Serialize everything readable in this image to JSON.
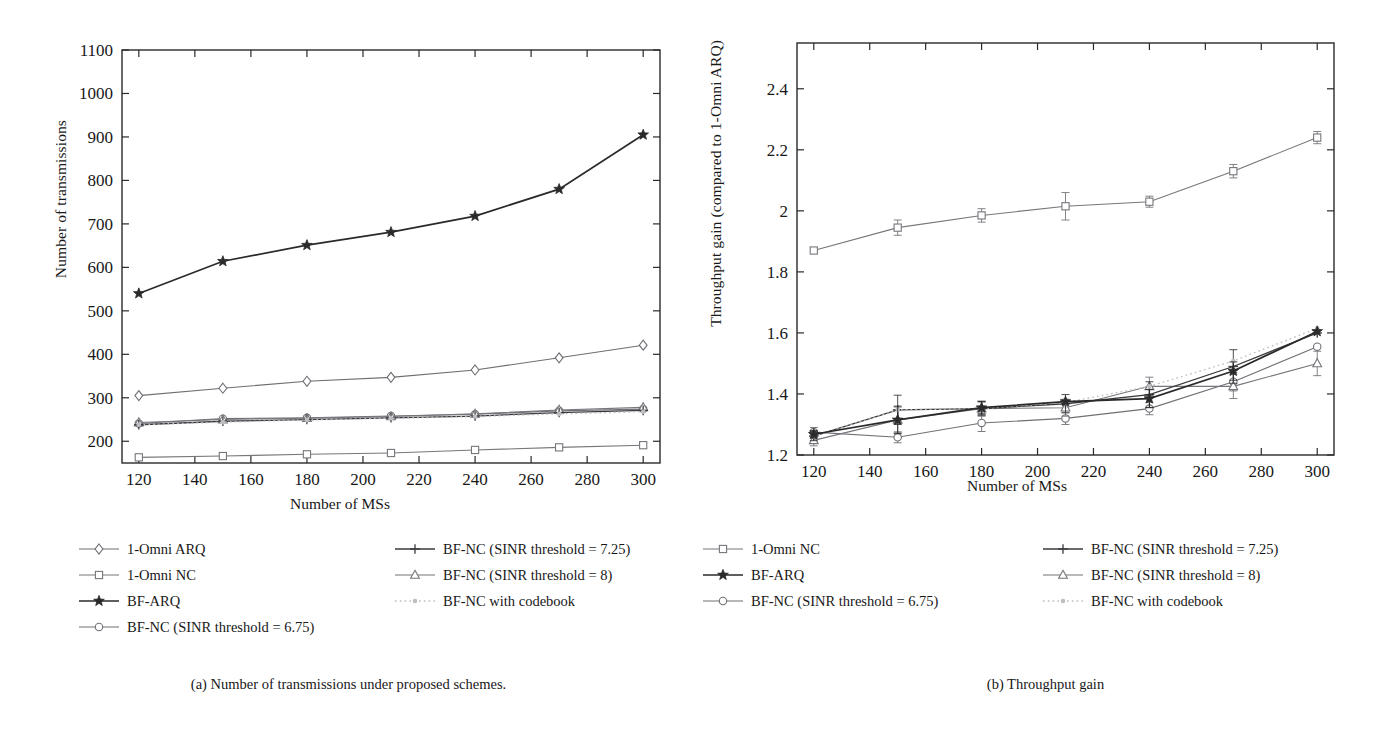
{
  "figure": {
    "panels": [
      {
        "id": "a",
        "caption": "(a)  Number of transmissions under proposed schemes.",
        "xlabel": "Number of MSs",
        "ylabel": "Number of transmissions"
      },
      {
        "id": "b",
        "caption": "(b)  Throughput gain",
        "xlabel": "Number of MSs",
        "ylabel": "Throughput gain (compared to 1-Omni ARQ)"
      }
    ]
  },
  "chart_data": [
    {
      "type": "line",
      "title": "(a)  Number of transmissions under proposed schemes.",
      "xlabel": "Number of MSs",
      "ylabel": "Number of transmissions",
      "x": [
        120,
        150,
        180,
        210,
        240,
        270,
        300
      ],
      "xlim": [
        114,
        306
      ],
      "ylim": [
        150,
        1100
      ],
      "xticks": [
        120,
        140,
        160,
        180,
        200,
        220,
        240,
        260,
        280,
        300
      ],
      "yticks": [
        200,
        300,
        400,
        500,
        600,
        700,
        800,
        900,
        1000,
        1100
      ],
      "grid": false,
      "legend_position": "below",
      "series": [
        {
          "name": "1-Omni ARQ",
          "marker": "diamond",
          "linestyle": "solid",
          "values": [
            305,
            322,
            338,
            347,
            364,
            392,
            421
          ]
        },
        {
          "name": "1-Omni NC",
          "marker": "square",
          "linestyle": "solid",
          "values": [
            163,
            166,
            170,
            173,
            180,
            186,
            191
          ]
        },
        {
          "name": "BF-ARQ",
          "marker": "star",
          "linestyle": "solid",
          "values": [
            540,
            614,
            651,
            681,
            718,
            780,
            905
          ]
        },
        {
          "name": "BF-NC (SINR threshold = 6.75)",
          "marker": "circle",
          "linestyle": "solid",
          "values": [
            241,
            252,
            254,
            258,
            262,
            270,
            274
          ]
        },
        {
          "name": "BF-NC (SINR threshold = 7.25)",
          "marker": "plus",
          "linestyle": "solid",
          "values": [
            238,
            246,
            250,
            254,
            258,
            266,
            271
          ]
        },
        {
          "name": "BF-NC (SINR threshold = 8)",
          "marker": "triangle",
          "linestyle": "solid",
          "values": [
            243,
            250,
            253,
            257,
            263,
            272,
            278
          ]
        },
        {
          "name": "BF-NC with codebook",
          "marker": "dot",
          "linestyle": "dotted",
          "values": [
            238,
            244,
            249,
            253,
            257,
            263,
            268
          ]
        }
      ]
    },
    {
      "type": "line",
      "title": "(b)  Throughput gain",
      "xlabel": "Number of MSs",
      "ylabel": "Throughput gain (compared to 1-Omni ARQ)",
      "x": [
        120,
        150,
        180,
        210,
        240,
        270,
        300
      ],
      "xlim": [
        114,
        306
      ],
      "ylim": [
        1.2,
        2.55
      ],
      "xticks": [
        120,
        140,
        160,
        180,
        200,
        220,
        240,
        260,
        280,
        300
      ],
      "yticks": [
        1.2,
        1.4,
        1.6,
        1.8,
        2,
        2.2,
        2.4
      ],
      "grid": false,
      "legend_position": "below",
      "errorbars": true,
      "series": [
        {
          "name": "1-Omni NC",
          "marker": "square",
          "linestyle": "solid",
          "values": [
            1.87,
            1.945,
            1.985,
            2.015,
            2.03,
            2.13,
            2.24
          ],
          "errors": [
            0.0,
            0.025,
            0.022,
            0.045,
            0.018,
            0.022,
            0.02
          ]
        },
        {
          "name": "BF-ARQ",
          "marker": "star",
          "linestyle": "solid",
          "values": [
            1.268,
            1.315,
            1.355,
            1.375,
            1.385,
            1.475,
            1.605
          ],
          "errors": [
            0.012,
            0.045,
            0.02,
            0.0,
            0.03,
            0.03,
            0.0
          ]
        },
        {
          "name": "BF-NC (SINR threshold = 6.75)",
          "marker": "circle",
          "linestyle": "solid",
          "values": [
            1.275,
            1.258,
            1.305,
            1.32,
            1.352,
            1.44,
            1.555
          ],
          "errors": [
            0.015,
            0.018,
            0.028,
            0.02,
            0.02,
            0.03,
            0.0
          ]
        },
        {
          "name": "BF-NC (SINR threshold = 7.25)",
          "marker": "plus",
          "linestyle": "solid",
          "values": [
            1.262,
            1.348,
            1.352,
            1.368,
            1.398,
            1.49,
            1.6
          ],
          "errors": [
            0.015,
            0.048,
            0.022,
            0.03,
            0.042,
            0.055,
            0.0
          ]
        },
        {
          "name": "BF-NC (SINR threshold = 8)",
          "marker": "triangle",
          "linestyle": "solid",
          "values": [
            1.248,
            1.315,
            1.352,
            1.355,
            1.425,
            1.425,
            1.5
          ],
          "errors": [
            0.018,
            0.042,
            0.025,
            0.028,
            0.03,
            0.04,
            0.04
          ]
        },
        {
          "name": "BF-NC with codebook",
          "marker": "dot",
          "linestyle": "dotted",
          "values": [
            1.262,
            1.348,
            1.352,
            1.372,
            1.425,
            1.508,
            1.615
          ],
          "errors": [
            0,
            0,
            0,
            0,
            0,
            0,
            0
          ]
        }
      ]
    }
  ],
  "legend_a": {
    "left": [
      {
        "label": "1-Omni ARQ",
        "marker": "diamond",
        "linestyle": "solid"
      },
      {
        "label": "1-Omni NC",
        "marker": "square",
        "linestyle": "solid"
      },
      {
        "label": "BF-ARQ",
        "marker": "star",
        "linestyle": "solid"
      },
      {
        "label": "BF-NC (SINR threshold = 6.75)",
        "marker": "circle",
        "linestyle": "solid"
      }
    ],
    "right": [
      {
        "label": "BF-NC (SINR threshold = 7.25)",
        "marker": "plus",
        "linestyle": "solid"
      },
      {
        "label": "BF-NC (SINR threshold = 8)",
        "marker": "triangle",
        "linestyle": "solid"
      },
      {
        "label": "BF-NC with codebook",
        "marker": "dot",
        "linestyle": "dotted"
      }
    ]
  },
  "legend_b": {
    "left": [
      {
        "label": "1-Omni NC",
        "marker": "square",
        "linestyle": "solid"
      },
      {
        "label": "BF-ARQ",
        "marker": "star",
        "linestyle": "solid"
      },
      {
        "label": "BF-NC (SINR threshold = 6.75)",
        "marker": "circle",
        "linestyle": "solid"
      }
    ],
    "right": [
      {
        "label": "BF-NC (SINR threshold = 7.25)",
        "marker": "plus",
        "linestyle": "solid"
      },
      {
        "label": "BF-NC (SINR threshold = 8)",
        "marker": "triangle",
        "linestyle": "solid"
      },
      {
        "label": "BF-NC with codebook",
        "marker": "dot",
        "linestyle": "dotted"
      }
    ]
  },
  "colors": {
    "line_dark": "#2a2a2a",
    "line_mid": "#55555a",
    "line_light": "#8a8a90",
    "dotted": "#b5b5ba",
    "text": "#181818"
  }
}
